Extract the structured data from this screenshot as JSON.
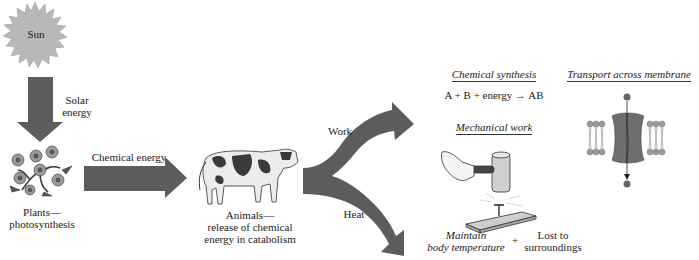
{
  "figure": {
    "colors": {
      "arrow": "#5c5c5c",
      "sun": "#b8b8b8",
      "sun_stroke": "#9a9a9a",
      "text": "#222222",
      "protein": "#6e6e6e",
      "lipid_head": "#9a9a9a"
    },
    "sun": {
      "label": "Sun",
      "icon": "sun-icon"
    },
    "solar_arrow": {
      "label_line1": "Solar",
      "label_line2": "energy"
    },
    "plants": {
      "icon": "flower-plant-icon",
      "label_line1": "Plants—",
      "label_line2": "photosynthesis"
    },
    "chemical_arrow": {
      "label": "Chemical energy"
    },
    "animals": {
      "icon": "cow-icon",
      "label_line1": "Animals—",
      "label_line2": "release of chemical",
      "label_line3": "energy in catabolism"
    },
    "split_arrow": {
      "upper_label": "Work",
      "lower_label": "Heat"
    },
    "work_outputs": {
      "chemical_synthesis": {
        "title": "Chemical synthesis",
        "equation_left": "A + B + energy",
        "equation_arrow": "→",
        "equation_right": "AB"
      },
      "mechanical_work": {
        "title": "Mechanical work",
        "icon": "hammer-nail-icon"
      },
      "transport": {
        "title": "Transport across membrane",
        "icon": "membrane-channel-icon"
      }
    },
    "heat_outputs": {
      "maintain_line1": "Maintain",
      "maintain_line2": "body temperature",
      "plus": "+",
      "lost_line1": "Lost to",
      "lost_line2": "surroundings"
    }
  }
}
